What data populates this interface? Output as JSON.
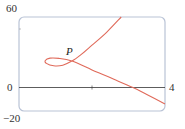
{
  "chart_data": {
    "type": "line",
    "title": "",
    "xlabel": "",
    "ylabel": "",
    "xlim": [
      0,
      4
    ],
    "ylim": [
      -20,
      60
    ],
    "grid": false,
    "legend": null,
    "x_tick_labels": [
      "4"
    ],
    "y_tick_labels": [
      "60",
      "0",
      "-20"
    ],
    "annotations": [
      {
        "text": "P",
        "x": 1.45,
        "y": 22.5,
        "description": "self-intersection point of the curve"
      }
    ],
    "series": [
      {
        "name": "parametric curve",
        "color": "#e06a5a",
        "points": [
          [
            2.8,
            60
          ],
          [
            2.4,
            47
          ],
          [
            2.0,
            36
          ],
          [
            1.7,
            28
          ],
          [
            1.45,
            22.5
          ],
          [
            1.2,
            19
          ],
          [
            0.95,
            18.5
          ],
          [
            0.75,
            20.5
          ],
          [
            0.72,
            23
          ],
          [
            0.85,
            25
          ],
          [
            1.1,
            24.8
          ],
          [
            1.45,
            22.5
          ],
          [
            2.0,
            15
          ],
          [
            2.6,
            7
          ],
          [
            3.12,
            0
          ],
          [
            3.5,
            -6
          ],
          [
            4.0,
            -14
          ]
        ]
      }
    ]
  },
  "labels": {
    "y_top": "60",
    "y_zero": "0",
    "y_bottom": "−20",
    "x_right": "4",
    "point": "P"
  },
  "colors": {
    "curve": "#e06a5a",
    "frame": "#b9c3d6",
    "axis": "#333333"
  }
}
